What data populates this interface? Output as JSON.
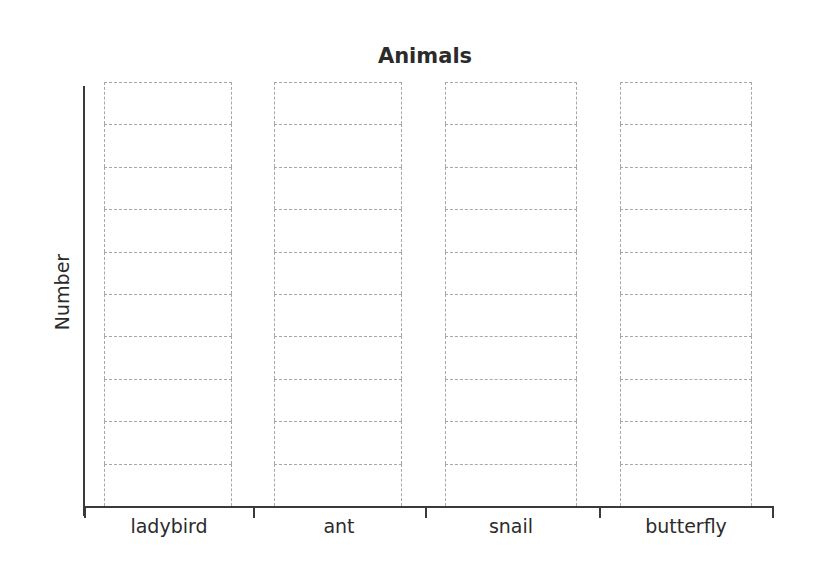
{
  "chart_data": {
    "type": "bar",
    "title": "Animals",
    "xlabel": "",
    "ylabel": "Number",
    "categories": [
      "ladybird",
      "ant",
      "snail",
      "butterfly"
    ],
    "values": [
      0,
      0,
      0,
      0
    ],
    "grid_cells_per_bar": 10,
    "ylim": [
      0,
      10
    ],
    "grid": true,
    "note": "blank template - bars are empty dashed cell grids",
    "legend": null
  },
  "chart": {
    "title": "Animals",
    "ylabel": "Number",
    "bars": [
      {
        "label": "ladybird",
        "cells": 10
      },
      {
        "label": "ant",
        "cells": 10
      },
      {
        "label": "snail",
        "cells": 10
      },
      {
        "label": "butterfly",
        "cells": 10
      }
    ]
  }
}
